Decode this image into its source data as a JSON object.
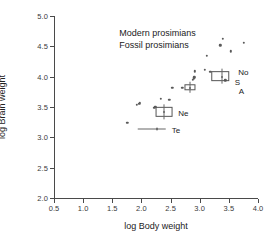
{
  "chart_data": {
    "type": "scatter",
    "title": "",
    "xlabel": "log Body weight",
    "ylabel": "log Brain weight",
    "xlim": [
      0.5,
      4.0
    ],
    "ylim": [
      2.0,
      5.0
    ],
    "xticks": [
      "0.5",
      "1.0",
      "1.5",
      "2.0",
      "2.5",
      "3.0",
      "3.5",
      "4.0"
    ],
    "yticks": [
      "2.0",
      "2.5",
      "3.0",
      "3.5",
      "4.0",
      "4.5",
      "5.0"
    ],
    "grid": false,
    "legend_position": "upper-left-inside",
    "legend": [
      "Modern prosimians",
      "Fossil prosimians"
    ],
    "series": [
      {
        "name": "Modern prosimians",
        "marker": "filled-circle",
        "color": "#5a5a5a",
        "points": [
          {
            "x": 1.76,
            "y": 3.24
          },
          {
            "x": 1.92,
            "y": 3.54
          },
          {
            "x": 1.95,
            "y": 3.55
          },
          {
            "x": 1.97,
            "y": 3.56
          },
          {
            "x": 2.22,
            "y": 3.49
          },
          {
            "x": 2.24,
            "y": 3.5
          },
          {
            "x": 2.33,
            "y": 3.64
          },
          {
            "x": 2.48,
            "y": 3.62
          },
          {
            "x": 2.53,
            "y": 3.82
          },
          {
            "x": 2.7,
            "y": 3.82
          },
          {
            "x": 2.88,
            "y": 3.95
          },
          {
            "x": 2.9,
            "y": 3.97
          },
          {
            "x": 2.91,
            "y": 3.99
          },
          {
            "x": 2.92,
            "y": 4.09
          },
          {
            "x": 3.09,
            "y": 4.11
          },
          {
            "x": 3.12,
            "y": 4.34
          },
          {
            "x": 3.18,
            "y": 4.08
          },
          {
            "x": 3.35,
            "y": 4.52
          },
          {
            "x": 3.4,
            "y": 4.62
          },
          {
            "x": 3.44,
            "y": 3.94
          },
          {
            "x": 3.53,
            "y": 4.42
          },
          {
            "x": 3.76,
            "y": 4.56
          }
        ]
      }
    ],
    "fossil_boxes": [
      {
        "label": "Ne",
        "x_min": 2.24,
        "x_max": 2.53,
        "y_min": 3.33,
        "y_max": 3.5,
        "center_x": 2.38,
        "center_y": 3.42,
        "label_x": 2.63,
        "label_y": 3.4
      },
      {
        "label": "",
        "x_min": 2.74,
        "x_max": 2.93,
        "y_min": 3.78,
        "y_max": 3.87,
        "center_x": 2.83,
        "center_y": 3.82,
        "label_x": 0,
        "label_y": 0
      },
      {
        "label": "",
        "x_min": 3.2,
        "x_max": 3.5,
        "y_min": 3.93,
        "y_max": 4.09,
        "center_x": 3.38,
        "center_y": 4.0,
        "label_x": 0,
        "label_y": 0
      }
    ],
    "fossil_errorbars": [
      {
        "label": "Te",
        "x_min": 1.93,
        "x_max": 2.42,
        "center_x": 2.26,
        "center_y": 3.13,
        "label_x": 2.52,
        "label_y": 3.12
      }
    ],
    "annotations": [
      {
        "text": "No",
        "x": 3.66,
        "y": 4.08
      },
      {
        "text": "S",
        "x": 3.6,
        "y": 3.92
      },
      {
        "text": "A",
        "x": 3.67,
        "y": 3.77
      }
    ]
  },
  "legend": {
    "modern_label": "Modern prosimians",
    "fossil_label": "Fossil prosimians"
  },
  "axes": {
    "x_title": "log Body weight",
    "y_title": "log Brain weight"
  }
}
